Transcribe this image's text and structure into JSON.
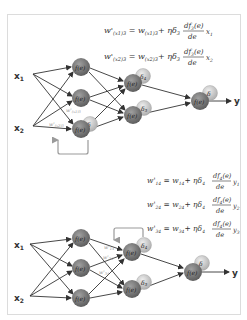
{
  "figure": {
    "colors": {
      "node": "#7a7a7a",
      "delta_node": "#c8c8c8",
      "edge": "#333333",
      "feedback_arrow": "#9a9a9a",
      "frame": "#dcdcdc"
    }
  },
  "top": {
    "inputs": [
      "x",
      "x"
    ],
    "input_subs": [
      "1",
      "2"
    ],
    "node_label": "f(e)",
    "deltas": {
      "hidden_a": "δ",
      "hidden_a_sub": "4",
      "hidden_b": "δ",
      "hidden_b_sub": "5",
      "output": "δ",
      "first_layer": "δ"
    },
    "output_label": "y",
    "weight_labels": [
      "w'(x2)1... ",
      "w'(x1)3"
    ],
    "weight_label_a": "w'",
    "weight_label_a_sub": "(x1)3",
    "weight_label_b": "w'",
    "weight_label_b_sub": "(x2)3",
    "equations": [
      {
        "lhs": "w'",
        "lhs_sub": "(x1)3",
        "rhs1": "w",
        "rhs1_sub": "(x1)3",
        "plus": "+ ηδ",
        "delta_sub": "3",
        "num": "df",
        "num_sub": "3",
        "num_tail": "(e)",
        "den": "de",
        "var": "x",
        "var_sub": "1"
      },
      {
        "lhs": "w'",
        "lhs_sub": "(x2)3",
        "rhs1": "w",
        "rhs1_sub": "(x2)3",
        "plus": "+ ηδ",
        "delta_sub": "3",
        "num": "df",
        "num_sub": "3",
        "num_tail": "(e)",
        "den": "de",
        "var": "x",
        "var_sub": "2"
      }
    ]
  },
  "bottom": {
    "inputs": [
      "x",
      "x"
    ],
    "input_subs": [
      "1",
      "2"
    ],
    "node_label": "f(e)",
    "deltas": {
      "hidden_a": "δ",
      "hidden_a_sub": "4",
      "hidden_b": "δ",
      "hidden_b_sub": "5",
      "output": "δ"
    },
    "output_label": "y",
    "weight_labels": [
      {
        "text": "w'",
        "sub": "14"
      },
      {
        "text": "w'",
        "sub": "24"
      },
      {
        "text": "w'",
        "sub": "34"
      }
    ],
    "equations": [
      {
        "lhs": "w'",
        "lhs_sub": "14",
        "rhs1": "w",
        "rhs1_sub": "14",
        "plus": "+ ηδ",
        "delta_sub": "4",
        "num": "df",
        "num_sub": "4",
        "num_tail": "(e)",
        "den": "de",
        "var": "y",
        "var_sub": "1"
      },
      {
        "lhs": "w'",
        "lhs_sub": "24",
        "rhs1": "w",
        "rhs1_sub": "24",
        "plus": "+ ηδ",
        "delta_sub": "4",
        "num": "df",
        "num_sub": "4",
        "num_tail": "(e)",
        "den": "de",
        "var": "y",
        "var_sub": "2"
      },
      {
        "lhs": "w'",
        "lhs_sub": "34",
        "rhs1": "w",
        "rhs1_sub": "34",
        "plus": "+ ηδ",
        "delta_sub": "4",
        "num": "df",
        "num_sub": "4",
        "num_tail": "(e)",
        "den": "de",
        "var": "y",
        "var_sub": "3"
      }
    ]
  }
}
